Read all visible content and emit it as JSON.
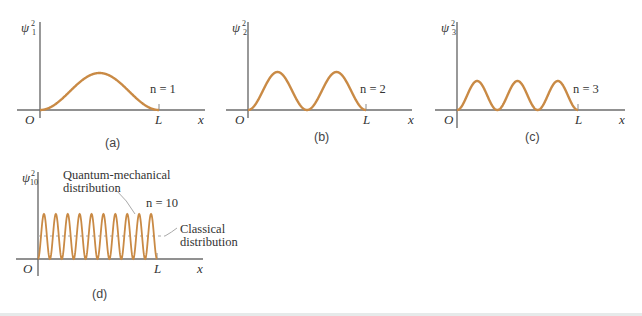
{
  "chart_data": [
    {
      "type": "line",
      "panel": "(a)",
      "ylabel": "ψ₁²",
      "ylabel_base": "ψ",
      "ylabel_sup": "2",
      "ylabel_sub": "1",
      "xlabel": "x",
      "origin_label": "O",
      "end_label": "L",
      "annotation": "n = 1",
      "n": 1,
      "function": "sin^2(n*pi*x/L)",
      "x_range": [
        0,
        1
      ],
      "peaks": 1,
      "grid": false
    },
    {
      "type": "line",
      "panel": "(b)",
      "ylabel": "ψ₂²",
      "ylabel_base": "ψ",
      "ylabel_sup": "2",
      "ylabel_sub": "2",
      "xlabel": "x",
      "origin_label": "O",
      "end_label": "L",
      "annotation": "n = 2",
      "n": 2,
      "function": "sin^2(n*pi*x/L)",
      "x_range": [
        0,
        1
      ],
      "peaks": 2,
      "grid": false
    },
    {
      "type": "line",
      "panel": "(c)",
      "ylabel": "ψ₃²",
      "ylabel_base": "ψ",
      "ylabel_sup": "2",
      "ylabel_sub": "3",
      "xlabel": "x",
      "origin_label": "O",
      "end_label": "L",
      "annotation": "n = 3",
      "n": 3,
      "function": "sin^2(n*pi*x/L)",
      "x_range": [
        0,
        1
      ],
      "peaks": 3,
      "grid": false
    },
    {
      "type": "line",
      "panel": "(d)",
      "ylabel": "ψ₁₀²",
      "ylabel_base": "ψ",
      "ylabel_sup": "2",
      "ylabel_sub": "10",
      "xlabel": "x",
      "origin_label": "O",
      "end_label": "L",
      "annotation": "n = 10",
      "n": 10,
      "function": "sin^2(n*pi*x/L)",
      "x_range": [
        0,
        1
      ],
      "peaks": 10,
      "series": [
        {
          "name": "Quantum-mechanical distribution",
          "style": "solid"
        },
        {
          "name": "Classical distribution",
          "style": "dashed",
          "value": 0.5
        }
      ],
      "callouts": [
        {
          "line1": "Quantum-mechanical",
          "line2": "distribution"
        },
        {
          "line1": "Classical",
          "line2": "distribution"
        }
      ],
      "grid": false
    }
  ],
  "colors": {
    "curve": "#c98a45",
    "axis": "#6d6d6d",
    "classical_dash": "#a9a9a9",
    "text": "#333333"
  }
}
